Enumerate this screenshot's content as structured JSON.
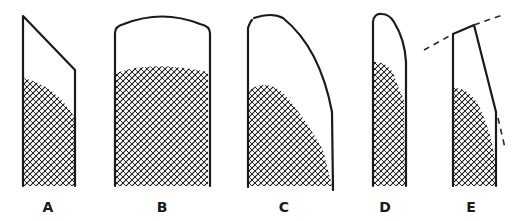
{
  "figure": {
    "ink_color": "#1a1a1a",
    "background": "#ffffff",
    "panels": [
      {
        "label": "A",
        "shape": "slanted-top column"
      },
      {
        "label": "B",
        "shape": "domed-top column"
      },
      {
        "label": "C",
        "shape": "curved asymmetric top"
      },
      {
        "label": "D",
        "shape": "narrow rounded top"
      },
      {
        "label": "E",
        "shape": "tapered with dashed extensions"
      }
    ]
  }
}
